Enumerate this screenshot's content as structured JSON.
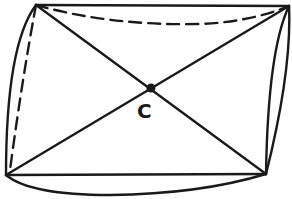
{
  "diagram": {
    "center_label": "C",
    "colors": {
      "stroke": "#1a1a1a",
      "background": "#ffffff"
    },
    "vertices": {
      "top_left": [
        36,
        5
      ],
      "top_right": [
        289,
        6
      ],
      "bottom_left": [
        6,
        175
      ],
      "bottom_right": [
        266,
        174
      ],
      "center": [
        151,
        88
      ]
    },
    "edges": [
      {
        "name": "top-straight",
        "style": "solid"
      },
      {
        "name": "top-curved",
        "style": "dashed"
      },
      {
        "name": "left-straight",
        "style": "dashed"
      },
      {
        "name": "left-curved",
        "style": "solid"
      },
      {
        "name": "bottom-straight",
        "style": "solid"
      },
      {
        "name": "bottom-curved",
        "style": "solid"
      },
      {
        "name": "right-inner-curve",
        "style": "solid"
      },
      {
        "name": "right-outer-curve",
        "style": "solid"
      },
      {
        "name": "diagonal-tl-br",
        "style": "solid"
      },
      {
        "name": "diagonal-tr-bl",
        "style": "solid"
      }
    ]
  }
}
